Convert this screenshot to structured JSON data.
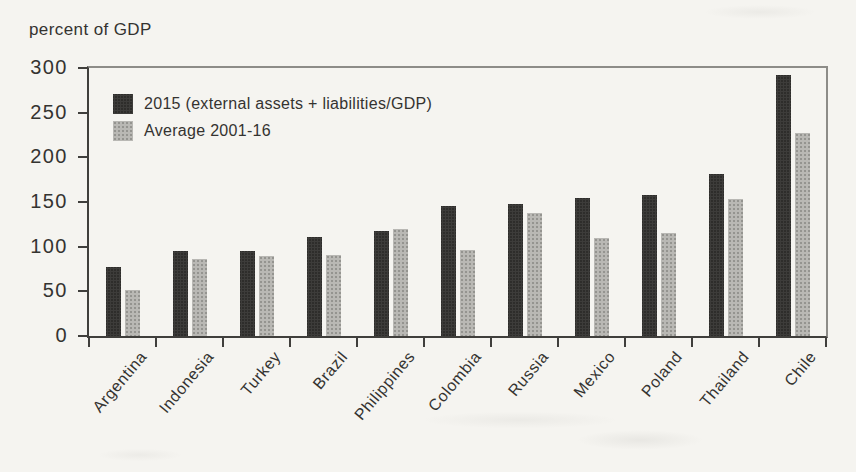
{
  "chart_data": {
    "type": "bar",
    "title": "",
    "ylabel": "percent of GDP",
    "xlabel": "",
    "categories": [
      "Argentina",
      "Indonesia",
      "Turkey",
      "Brazil",
      "Philippines",
      "Colombia",
      "Russia",
      "Mexico",
      "Poland",
      "Thailand",
      "Chile"
    ],
    "series": [
      {
        "name": "2015 (external assets + liabilities/GDP)",
        "color": "#2e2d2b",
        "values": [
          77,
          95,
          95,
          111,
          117,
          146,
          148,
          155,
          158,
          181,
          292
        ]
      },
      {
        "name": "Average 2001-16",
        "color": "#b9b8b4",
        "values": [
          52,
          86,
          90,
          91,
          120,
          96,
          138,
          110,
          115,
          153,
          227
        ]
      }
    ],
    "ylim": [
      0,
      300
    ],
    "yticks": [
      0,
      50,
      100,
      150,
      200,
      250,
      300
    ],
    "grid": false,
    "legend_position": "top-left-inside",
    "category_label_rotation_deg": -50
  }
}
